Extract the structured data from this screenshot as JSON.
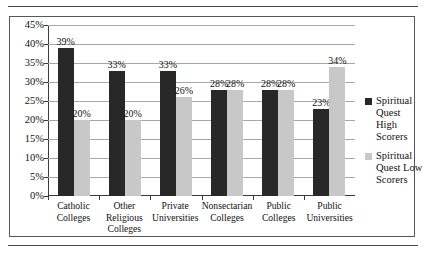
{
  "chart_data": {
    "type": "bar",
    "title": "",
    "subtitle": "",
    "xlabel": "",
    "ylabel": "",
    "ylim": [
      0,
      45
    ],
    "ytick_step": 5,
    "ytick_labels": [
      "0%",
      "5%",
      "10%",
      "15%",
      "20%",
      "25%",
      "30%",
      "35%",
      "40%",
      "45%"
    ],
    "grid": true,
    "legend_position": "right",
    "categories": [
      "Catholic Colleges",
      "Other Religious Colleges",
      "Private Universities",
      "Nonsectarian Colleges",
      "Public Colleges",
      "Public Universities"
    ],
    "series": [
      {
        "name": "Spiritual Quest High Scorers",
        "color": "#282828",
        "values": [
          39,
          33,
          33,
          28,
          28,
          23
        ],
        "labels": [
          "39%",
          "33%",
          "33%",
          "28%",
          "28%",
          "23%"
        ]
      },
      {
        "name": "Spiritual Quest Low Scorers",
        "color": "#c8c8c8",
        "values": [
          20,
          20,
          26,
          28,
          28,
          34
        ],
        "labels": [
          "20%",
          "20%",
          "26%",
          "28%",
          "28%",
          "34%"
        ]
      }
    ]
  },
  "legend": {
    "items": [
      {
        "label": "Spiritual Quest High Scorers",
        "swatch": "high"
      },
      {
        "label": "Spiritual Quest Low Scorers",
        "swatch": "low"
      }
    ]
  }
}
